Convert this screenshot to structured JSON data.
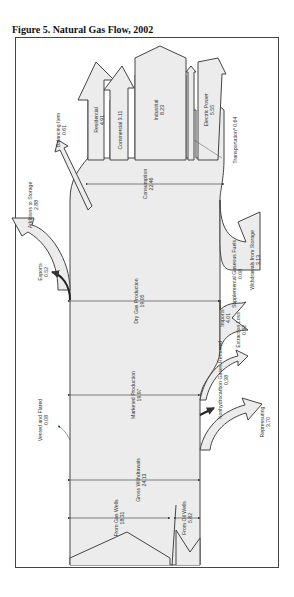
{
  "figure": {
    "title": "Figure 5.  Natural Gas Flow, 2002"
  },
  "colors": {
    "fill": "#ececec",
    "stroke": "#444444",
    "text": "#333333"
  },
  "flows": {
    "gross_withdrawals": {
      "label": "Gross Withdrawals",
      "value": "24.13"
    },
    "from_gas_wells": {
      "label": "From Gas Wells",
      "value": "18.31"
    },
    "from_oil_wells": {
      "label": "From Oil Wells",
      "value": "5.82"
    },
    "vented_flared": {
      "label": "Vented and Flared",
      "value": "0.08"
    },
    "repressuring": {
      "label": "Repressuring",
      "value": "3.70"
    },
    "nonhydrocarbon": {
      "label": "Nonhydrocarbon Gases Removed",
      "value": "0.38"
    },
    "marketed_production": {
      "label": "Marketed Production",
      "value": "19.97"
    },
    "extraction_loss": {
      "label": "Extraction Loss",
      "value": "0.92"
    },
    "dry_gas_production": {
      "label": "Dry Gas Production",
      "value": "19.05"
    },
    "imports": {
      "label": "Imports",
      "value": "4.01"
    },
    "supplemental": {
      "label": "Supplemental Gaseous Fuels",
      "value": "0.08"
    },
    "withdrawals_storage": {
      "label": "Withdrawals from Storage",
      "value": "3.13"
    },
    "exports": {
      "label": "Exports",
      "value": "0.52"
    },
    "additions_storage": {
      "label": "Additions to Storage",
      "value": "2.88"
    },
    "balancing_item": {
      "label": "Balancing Item",
      "value": "0.61"
    },
    "consumption": {
      "label": "Consumption",
      "value": "22.46"
    },
    "residential": {
      "label": "Residential",
      "value": "4.91"
    },
    "commercial": {
      "label": "Commercial",
      "value": "3.11"
    },
    "industrial": {
      "label": "Industrial",
      "value": "8.23"
    },
    "electric_power": {
      "label": "Electric Power",
      "value": "5.55"
    },
    "transportation": {
      "label": "Transportation",
      "footnote": "a",
      "value": "0.64"
    }
  }
}
